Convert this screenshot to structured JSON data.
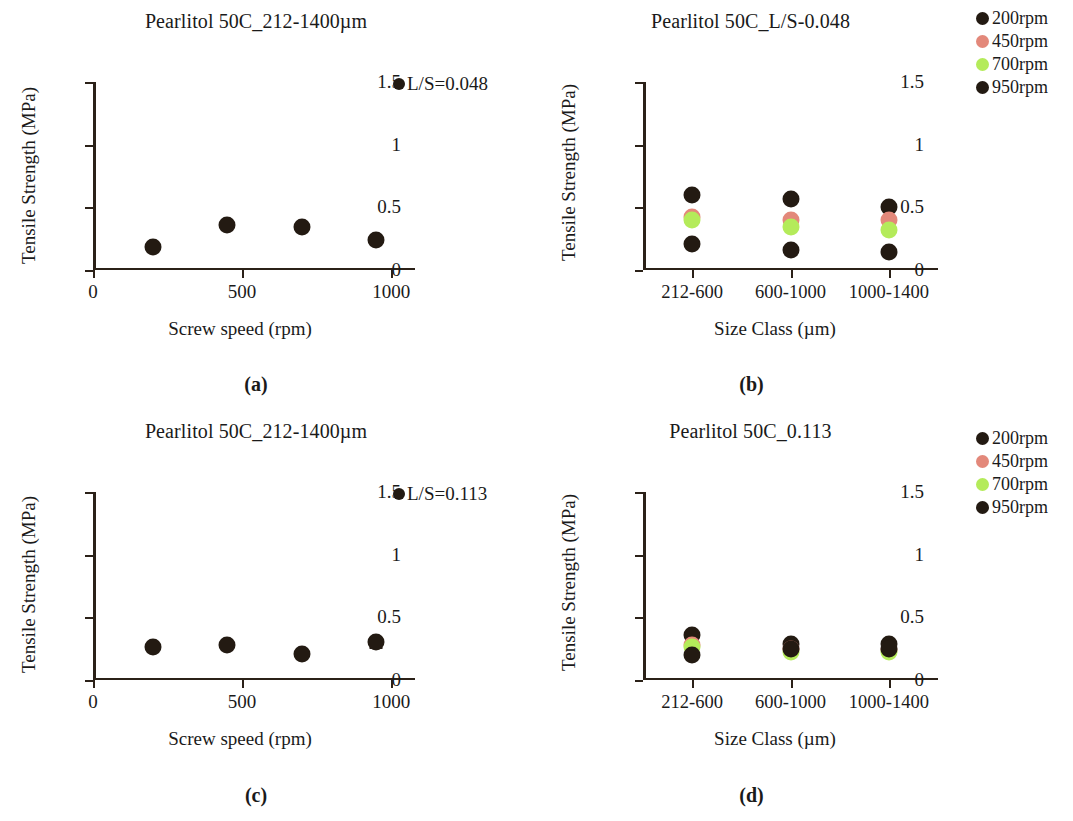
{
  "figure": {
    "panels": [
      {
        "id": "a",
        "caption": "(a)",
        "title": "Pearlitol 50C_212-1400µm",
        "xlabel": "Screw speed (rpm)",
        "ylabel": "Tensile  Strength (MPa)",
        "legend_inline": "L/S=0.048",
        "legend_inline_color": "#231a12",
        "yticks": [
          "0",
          "0.5",
          "1",
          "1.5"
        ],
        "xticks": [
          "0",
          "500",
          "1000"
        ]
      },
      {
        "id": "b",
        "caption": "(b)",
        "title": "Pearlitol 50C_L/S-0.048",
        "xlabel": "Size Class (µm)",
        "ylabel": "Tensile Strength (MPa)",
        "yticks": [
          "0",
          "0.5",
          "1",
          "1.5"
        ],
        "categories": [
          "212-600",
          "600-1000",
          "1000-1400"
        ],
        "legend": [
          {
            "label": "200rpm",
            "color": "#231a12"
          },
          {
            "label": "450rpm",
            "color": "#e3887a"
          },
          {
            "label": "700rpm",
            "color": "#b4eb5a"
          },
          {
            "label": "950rpm",
            "color": "#231a12"
          }
        ]
      },
      {
        "id": "c",
        "caption": "(c)",
        "title": "Pearlitol 50C_212-1400µm",
        "xlabel": "Screw speed (rpm)",
        "ylabel": "Tensile Strength (MPa)",
        "legend_inline": "L/S=0.113",
        "legend_inline_color": "#231a12",
        "yticks": [
          "0",
          "0.5",
          "1",
          "1.5"
        ],
        "xticks": [
          "0",
          "500",
          "1000"
        ]
      },
      {
        "id": "d",
        "caption": "(d)",
        "title": "Pearlitol 50C_0.113",
        "xlabel": "Size Class (µm)",
        "ylabel": "Tensile Strength (MPa)",
        "yticks": [
          "0",
          "0.5",
          "1",
          "1.5"
        ],
        "categories": [
          "212-600",
          "600-1000",
          "1000-1400"
        ],
        "legend": [
          {
            "label": "200rpm",
            "color": "#231a12"
          },
          {
            "label": "450rpm",
            "color": "#e3887a"
          },
          {
            "label": "700rpm",
            "color": "#b4eb5a"
          },
          {
            "label": "950rpm",
            "color": "#231a12"
          }
        ]
      }
    ]
  },
  "chart_data": [
    {
      "panel": "a",
      "type": "scatter",
      "title": "Pearlitol 50C_212-1400µm",
      "xlabel": "Screw speed (rpm)",
      "ylabel": "Tensile  Strength (MPa)",
      "xlim": [
        0,
        1080
      ],
      "ylim": [
        0,
        1.5
      ],
      "ytick_values": [
        0,
        0.5,
        1,
        1.5
      ],
      "xtick_values": [
        0,
        500,
        1000
      ],
      "grid": false,
      "legend_position": "top-right-inside",
      "series": [
        {
          "name": "L/S=0.048",
          "color": "#231a12",
          "x": [
            200,
            450,
            700,
            950
          ],
          "values": [
            0.18,
            0.36,
            0.34,
            0.24
          ]
        }
      ]
    },
    {
      "panel": "b",
      "type": "scatter",
      "title": "Pearlitol 50C_L/S-0.048",
      "xlabel": "Size Class (µm)",
      "ylabel": "Tensile Strength (MPa)",
      "categories": [
        "212-600",
        "600-1000",
        "1000-1400"
      ],
      "ylim": [
        0,
        1.5
      ],
      "ytick_values": [
        0,
        0.5,
        1,
        1.5
      ],
      "grid": false,
      "legend_position": "outside-top-right",
      "series": [
        {
          "name": "200rpm",
          "color": "#231a12",
          "values": [
            0.6,
            0.57,
            0.5
          ]
        },
        {
          "name": "450rpm",
          "color": "#e3887a",
          "values": [
            0.42,
            0.4,
            0.4
          ]
        },
        {
          "name": "700rpm",
          "color": "#b4eb5a",
          "values": [
            0.4,
            0.34,
            0.32
          ]
        },
        {
          "name": "950rpm",
          "color": "#231a12",
          "values": [
            0.21,
            0.16,
            0.14
          ]
        }
      ]
    },
    {
      "panel": "c",
      "type": "scatter",
      "title": "Pearlitol 50C_212-1400µm",
      "xlabel": "Screw speed (rpm)",
      "ylabel": "Tensile Strength (MPa)",
      "xlim": [
        0,
        1080
      ],
      "ylim": [
        0,
        1.5
      ],
      "ytick_values": [
        0,
        0.5,
        1,
        1.5
      ],
      "xtick_values": [
        0,
        500,
        1000
      ],
      "grid": false,
      "legend_position": "top-right-inside",
      "series": [
        {
          "name": "L/S=0.113",
          "color": "#231a12",
          "x": [
            200,
            450,
            700,
            950
          ],
          "values": [
            0.26,
            0.28,
            0.21,
            0.3
          ],
          "errors": [
            0,
            0,
            0,
            0.04
          ]
        }
      ]
    },
    {
      "panel": "d",
      "type": "scatter",
      "title": "Pearlitol 50C_0.113",
      "xlabel": "Size Class (µm)",
      "ylabel": "Tensile Strength (MPa)",
      "categories": [
        "212-600",
        "600-1000",
        "1000-1400"
      ],
      "ylim": [
        0,
        1.5
      ],
      "ytick_values": [
        0,
        0.5,
        1,
        1.5
      ],
      "grid": false,
      "legend_position": "outside-top-right",
      "series": [
        {
          "name": "200rpm",
          "color": "#231a12",
          "values": [
            0.36,
            0.29,
            0.29
          ]
        },
        {
          "name": "450rpm",
          "color": "#e3887a",
          "values": [
            0.28,
            0.25,
            0.24
          ]
        },
        {
          "name": "700rpm",
          "color": "#b4eb5a",
          "values": [
            0.26,
            0.22,
            0.22
          ]
        },
        {
          "name": "950rpm",
          "color": "#231a12",
          "values": [
            0.2,
            0.25,
            0.25
          ]
        }
      ]
    }
  ]
}
